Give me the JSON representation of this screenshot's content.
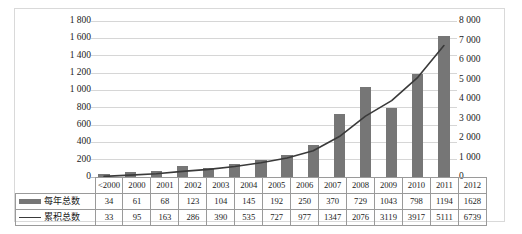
{
  "chart_data": {
    "type": "bar",
    "title": "",
    "xlabel": "",
    "ylabel": "",
    "grid": true,
    "legend_position": "table-left",
    "categories": [
      "<2000",
      "2000",
      "2001",
      "2002",
      "2003",
      "2004",
      "2005",
      "2006",
      "2007",
      "2008",
      "2009",
      "2010",
      "2011",
      "2012"
    ],
    "series": [
      {
        "name": "每年总数",
        "type": "bar",
        "axis": "left",
        "color": "#767676",
        "values": [
          34,
          61,
          68,
          123,
          104,
          145,
          192,
          250,
          370,
          729,
          1043,
          798,
          1194,
          1628
        ]
      },
      {
        "name": "累积总数",
        "type": "line",
        "axis": "right",
        "color": "#3a3a3a",
        "values": [
          33,
          95,
          163,
          286,
          390,
          535,
          727,
          977,
          1347,
          2076,
          3119,
          3917,
          5111,
          6739
        ]
      }
    ],
    "left_axis": {
      "ylim": [
        0,
        1800
      ],
      "step": 200,
      "ticks": [
        "0",
        "200",
        "400",
        "600",
        "800",
        "1 000",
        "1 200",
        "1 400",
        "1 600",
        "1 800"
      ]
    },
    "right_axis": {
      "ylim": [
        0,
        8000
      ],
      "step": 1000,
      "ticks": [
        "0",
        "1 000",
        "2 000",
        "3 000",
        "4 000",
        "5 000",
        "6 000",
        "7 000",
        "8 000"
      ]
    }
  },
  "table": {
    "rows": [
      {
        "label": "每年总数",
        "marker": "bar-swatch"
      },
      {
        "label": "累积总数",
        "marker": "line-swatch"
      }
    ]
  }
}
